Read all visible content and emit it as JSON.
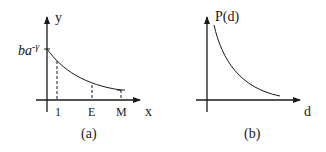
{
  "panels": [
    {
      "id": "a",
      "caption": "(a)",
      "y_axis_label": "y",
      "x_axis_label": "x",
      "y_intercept_label_base": "ba",
      "y_intercept_label_exp": "-γ",
      "x_ticks": [
        "1",
        "E",
        "M"
      ],
      "curve": "decreasing convex curve from y-intercept to M, dashed verticals at 1, E, M"
    },
    {
      "id": "b",
      "caption": "(b)",
      "y_axis_label": "P(d)",
      "x_axis_label": "d",
      "curve": "decreasing convex curve approaching x-axis"
    }
  ],
  "colors": {
    "ink": "#1a1a1a",
    "background": "#ffffff"
  }
}
